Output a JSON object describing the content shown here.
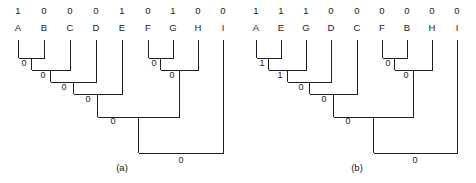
{
  "figure": {
    "background_color": "#ffffff",
    "line_color": "#231f20",
    "text_color": "#1a1a1a",
    "panels": [
      {
        "id": "panel-a",
        "caption": "(a)",
        "caption_x": 122,
        "caption_y": 171,
        "bits_y": 14,
        "leaf_y": 31,
        "leaf_top_y": 40,
        "leaves": [
          {
            "name": "A",
            "bit": "1",
            "x": 18
          },
          {
            "name": "B",
            "bit": "0",
            "x": 44
          },
          {
            "name": "C",
            "bit": "0",
            "x": 70
          },
          {
            "name": "D",
            "bit": "0",
            "x": 96
          },
          {
            "name": "E",
            "bit": "1",
            "x": 122
          },
          {
            "name": "F",
            "bit": "0",
            "x": 148
          },
          {
            "name": "G",
            "bit": "1",
            "x": 173
          },
          {
            "name": "H",
            "bit": "0",
            "x": 198
          },
          {
            "name": "I",
            "bit": "0",
            "x": 223
          }
        ],
        "merges": [
          {
            "id": "a-m1",
            "left_x": 18,
            "right_x": 44,
            "y": 58,
            "stem_x": 31,
            "label": "0",
            "label_x": 24,
            "label_y": 66
          },
          {
            "id": "a-m2",
            "left_x": 31,
            "right_x": 70,
            "y": 70,
            "stem_x": 50,
            "label": "0",
            "label_x": 43,
            "label_y": 78
          },
          {
            "id": "a-m3",
            "left_x": 50,
            "right_x": 96,
            "y": 82,
            "stem_x": 73,
            "label": "0",
            "label_x": 64,
            "label_y": 90
          },
          {
            "id": "a-m4",
            "left_x": 73,
            "right_x": 122,
            "y": 94,
            "stem_x": 97,
            "label": "0",
            "label_x": 88,
            "label_y": 102
          },
          {
            "id": "a-m5",
            "left_x": 148,
            "right_x": 173,
            "y": 58,
            "stem_x": 160,
            "label": "0",
            "label_x": 154,
            "label_y": 66
          },
          {
            "id": "a-m6",
            "left_x": 160,
            "right_x": 198,
            "y": 70,
            "stem_x": 179,
            "label": "0",
            "label_x": 172,
            "label_y": 78
          },
          {
            "id": "a-m7",
            "left_x": 97,
            "right_x": 179,
            "y": 117,
            "stem_x": 138,
            "label": "0",
            "label_x": 113,
            "label_y": 124
          },
          {
            "id": "a-m8",
            "left_x": 138,
            "right_x": 223,
            "y": 153,
            "stem_x": 180,
            "label": "0",
            "label_x": 181,
            "label_y": 163
          }
        ]
      },
      {
        "id": "panel-b",
        "caption": "(b)",
        "caption_x": 357,
        "caption_y": 171,
        "bits_y": 14,
        "leaf_y": 31,
        "leaf_top_y": 40,
        "leaves": [
          {
            "name": "A",
            "bit": "1",
            "x": 256
          },
          {
            "name": "E",
            "bit": "1",
            "x": 281
          },
          {
            "name": "G",
            "bit": "1",
            "x": 306
          },
          {
            "name": "D",
            "bit": "0",
            "x": 331
          },
          {
            "name": "C",
            "bit": "0",
            "x": 357
          },
          {
            "name": "F",
            "bit": "0",
            "x": 382
          },
          {
            "name": "B",
            "bit": "0",
            "x": 407
          },
          {
            "name": "H",
            "bit": "0",
            "x": 432
          },
          {
            "name": "I",
            "bit": "0",
            "x": 457
          }
        ],
        "merges": [
          {
            "id": "b-m1",
            "left_x": 256,
            "right_x": 281,
            "y": 58,
            "stem_x": 268,
            "label": "1",
            "label_x": 262,
            "label_y": 66
          },
          {
            "id": "b-m2",
            "left_x": 268,
            "right_x": 306,
            "y": 70,
            "stem_x": 287,
            "label": "1",
            "label_x": 280,
            "label_y": 78
          },
          {
            "id": "b-m3",
            "left_x": 287,
            "right_x": 331,
            "y": 82,
            "stem_x": 309,
            "label": "0",
            "label_x": 301,
            "label_y": 90
          },
          {
            "id": "b-m4",
            "left_x": 309,
            "right_x": 357,
            "y": 94,
            "stem_x": 333,
            "label": "0",
            "label_x": 324,
            "label_y": 102
          },
          {
            "id": "b-m5",
            "left_x": 382,
            "right_x": 407,
            "y": 58,
            "stem_x": 394,
            "label": "0",
            "label_x": 388,
            "label_y": 66
          },
          {
            "id": "b-m6",
            "left_x": 394,
            "right_x": 432,
            "y": 70,
            "stem_x": 413,
            "label": "0",
            "label_x": 406,
            "label_y": 78
          },
          {
            "id": "b-m7",
            "left_x": 333,
            "right_x": 413,
            "y": 117,
            "stem_x": 373,
            "label": "0",
            "label_x": 348,
            "label_y": 124
          },
          {
            "id": "b-m8",
            "left_x": 373,
            "right_x": 457,
            "y": 153,
            "stem_x": 415,
            "label": "0",
            "label_x": 415,
            "label_y": 163
          }
        ]
      }
    ]
  }
}
